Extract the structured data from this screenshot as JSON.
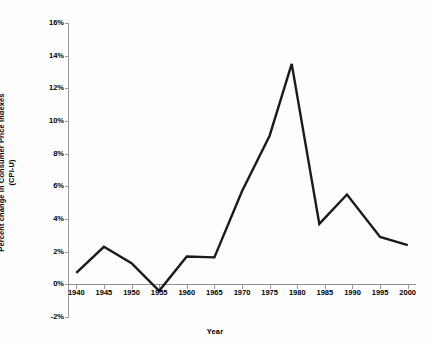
{
  "chart_data": {
    "type": "line",
    "title": "",
    "xlabel": "Year",
    "ylabel": "Percent change in Consumer Price Indexes (CPI-U)",
    "ylabel_line1": "Percent change in Consumer Price Indexes",
    "ylabel_line2": "(CPI-U)",
    "x": [
      1940,
      1945,
      1950,
      1955,
      1960,
      1965,
      1970,
      1975,
      1979,
      1984,
      1989,
      1995,
      2000
    ],
    "values": [
      0.7,
      2.3,
      1.3,
      -0.4,
      1.7,
      1.65,
      5.7,
      9.1,
      13.5,
      3.7,
      5.5,
      2.9,
      2.4
    ],
    "series": [
      {
        "name": "Percent change in CPI-U",
        "values": [
          0.7,
          2.3,
          1.3,
          -0.4,
          1.7,
          1.65,
          5.7,
          9.1,
          13.5,
          3.7,
          5.5,
          2.9,
          2.4
        ],
        "color": "#1a1a1a"
      }
    ],
    "xlim": [
      1938.5,
      2001.5
    ],
    "ylim": [
      -2,
      16
    ],
    "xticks": [
      1940,
      1945,
      1950,
      1955,
      1960,
      1965,
      1970,
      1975,
      1980,
      1985,
      1990,
      1995,
      2000
    ],
    "xticklabels": [
      "1940",
      "1945",
      "1950",
      "1955",
      "1960",
      "1965",
      "1970",
      "1975",
      "1980",
      "1985",
      "1990",
      "1995",
      "2000"
    ],
    "yticks": [
      -2,
      0,
      2,
      4,
      6,
      8,
      10,
      12,
      14,
      16
    ],
    "yticklabels": [
      "-2%",
      "0%",
      "2%",
      "4%",
      "6%",
      "8%",
      "10%",
      "12%",
      "14%",
      "16%"
    ],
    "grid": false,
    "legend": false,
    "background_color": "#fdfdfd",
    "axis_color": "#9a9a9a",
    "line_color": "#1a1a1a"
  }
}
